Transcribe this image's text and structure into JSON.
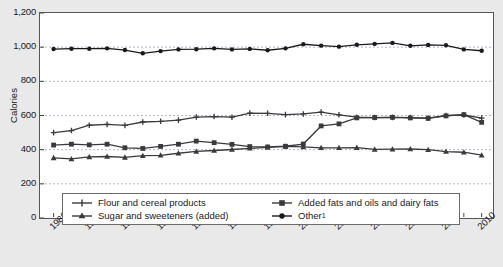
{
  "chart_data": {
    "type": "line",
    "title": "",
    "xlabel": "",
    "ylabel": "Calories",
    "ylim": [
      0,
      1200
    ],
    "xlim": [
      1986,
      2010
    ],
    "ytick_values": [
      0,
      200,
      400,
      600,
      800,
      1000,
      1200
    ],
    "ytick_labels": [
      "0",
      "200",
      "400",
      "600",
      "800",
      "1,000",
      "1,200"
    ],
    "xtick_labels": [
      "1986",
      "1988",
      "1990",
      "1992",
      "1994",
      "1996",
      "1998",
      "2000",
      "2002",
      "2004",
      "2006",
      "2008",
      "2010"
    ],
    "x": [
      1986,
      1987,
      1988,
      1989,
      1990,
      1991,
      1992,
      1993,
      1994,
      1995,
      1996,
      1997,
      1998,
      1999,
      2000,
      2001,
      2002,
      2003,
      2004,
      2005,
      2006,
      2007,
      2008,
      2009,
      2010
    ],
    "grid": true,
    "legend_position": "bottom",
    "series": [
      {
        "name": "Flour and cereal products",
        "marker": "plus",
        "color": "#3a3a3a",
        "values": [
          500,
          512,
          543,
          548,
          542,
          562,
          566,
          573,
          591,
          594,
          590,
          614,
          613,
          605,
          609,
          620,
          604,
          590,
          588,
          589,
          588,
          585,
          600,
          603,
          585
        ]
      },
      {
        "name": "Sugar and sweeteners (added)",
        "marker": "triangle",
        "color": "#3a3a3a",
        "values": [
          352,
          346,
          358,
          360,
          355,
          365,
          367,
          379,
          390,
          395,
          401,
          408,
          414,
          419,
          416,
          411,
          411,
          412,
          402,
          403,
          404,
          400,
          389,
          385,
          368
        ]
      },
      {
        "name": "Added fats and oils and dairy fats",
        "marker": "square",
        "color": "#3a3a3a",
        "values": [
          427,
          432,
          428,
          432,
          411,
          407,
          419,
          432,
          450,
          441,
          431,
          418,
          416,
          420,
          433,
          539,
          551,
          586,
          588,
          589,
          586,
          583,
          598,
          605,
          560
        ]
      },
      {
        "name": "Other",
        "marker": "dot",
        "color": "#1a1a1a",
        "values": [
          989,
          991,
          991,
          993,
          983,
          964,
          977,
          987,
          988,
          993,
          987,
          990,
          982,
          993,
          1017,
          1009,
          1003,
          1014,
          1019,
          1025,
          1008,
          1013,
          1011,
          987,
          979
        ]
      }
    ]
  },
  "legend": {
    "entries": [
      {
        "label": "Flour and cereal products"
      },
      {
        "label": "Sugar and sweeteners (added)"
      },
      {
        "label": "Added fats and oils and dairy fats"
      },
      {
        "label": "Other",
        "superscript": "1"
      }
    ]
  }
}
